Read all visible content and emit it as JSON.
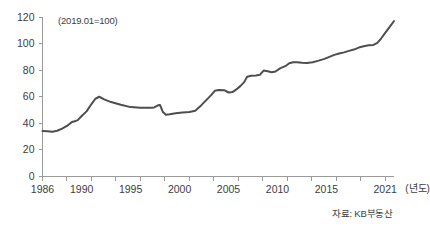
{
  "chart_data": {
    "type": "line",
    "title": "",
    "subtitle": "",
    "annotation": "(2019.01=100)",
    "source_note": "자료: KB부동산",
    "xlabel": "(년도)",
    "ylabel": "",
    "xlim": [
      1986,
      2021.9
    ],
    "ylim": [
      0,
      120
    ],
    "grid": false,
    "legend": "none",
    "line_color": "#4e4e4e",
    "axis_color": "#9a9a9a",
    "y_ticks": [
      0,
      20,
      40,
      60,
      80,
      100,
      120
    ],
    "x_ticks": [
      1986,
      1990,
      1995,
      2000,
      2005,
      2010,
      2015,
      2021
    ],
    "x_minor_ticks": [
      1986,
      1988.5,
      1991,
      1993.5,
      1996,
      1998.5,
      2001,
      2003.5,
      2006,
      2008.5,
      2011,
      2013.5,
      2016,
      2018.5,
      2021
    ],
    "series": [
      {
        "name": "주택매매가격지수",
        "x": [
          1986.0,
          1986.5,
          1987.0,
          1987.5,
          1988.0,
          1988.5,
          1989.0,
          1989.3,
          1989.6,
          1990.0,
          1990.5,
          1991.0,
          1991.4,
          1991.8,
          1992.3,
          1993.0,
          1994.0,
          1995.0,
          1996.0,
          1996.6,
          1997.0,
          1997.4,
          1997.8,
          1998.0,
          1998.3,
          1998.6,
          1999.0,
          1999.6,
          2000.3,
          2001.0,
          2001.6,
          2002.2,
          2002.8,
          2003.2,
          2003.6,
          2004.0,
          2004.6,
          2005.0,
          2005.4,
          2005.8,
          2006.2,
          2006.6,
          2006.9,
          2007.3,
          2007.8,
          2008.2,
          2008.6,
          2009.0,
          2009.4,
          2009.8,
          2010.3,
          2010.8,
          2011.2,
          2011.6,
          2012.0,
          2012.5,
          2013.0,
          2013.6,
          2014.2,
          2014.8,
          2015.3,
          2015.8,
          2016.3,
          2016.8,
          2017.3,
          2017.8,
          2018.3,
          2018.8,
          2019.3,
          2019.8,
          2020.2,
          2020.6,
          2021.0,
          2021.5,
          2021.9
        ],
        "values": [
          34.2,
          34.0,
          33.6,
          34.4,
          36.0,
          38.0,
          41.0,
          41.6,
          42.4,
          45.5,
          49.0,
          54.5,
          58.5,
          60.0,
          58.0,
          56.0,
          54.0,
          52.2,
          51.8,
          51.8,
          51.8,
          52.0,
          53.6,
          53.8,
          48.5,
          46.5,
          46.8,
          47.6,
          48.2,
          48.5,
          49.5,
          53.5,
          58.0,
          61.0,
          64.5,
          65.0,
          64.8,
          63.2,
          63.5,
          65.5,
          68.0,
          71.0,
          75.0,
          75.8,
          76.0,
          76.5,
          79.8,
          79.2,
          78.5,
          79.0,
          81.5,
          83.0,
          85.2,
          86.0,
          86.0,
          85.6,
          85.4,
          86.0,
          87.2,
          88.5,
          90.0,
          91.5,
          92.5,
          93.4,
          94.5,
          95.5,
          97.0,
          98.0,
          98.8,
          99.0,
          100.5,
          104.0,
          108.0,
          113.0,
          117.0
        ]
      }
    ]
  },
  "axis": {
    "y_labels": [
      "120",
      "100",
      "80",
      "60",
      "40",
      "20",
      "0"
    ],
    "x_labels": [
      "1986",
      "1990",
      "1995",
      "2000",
      "2005",
      "2010",
      "2015",
      "2021"
    ],
    "x_unit_label": "(년도)"
  },
  "note": {
    "text": "(2019.01=100)"
  },
  "source": {
    "text": "자료: KB부동산"
  }
}
